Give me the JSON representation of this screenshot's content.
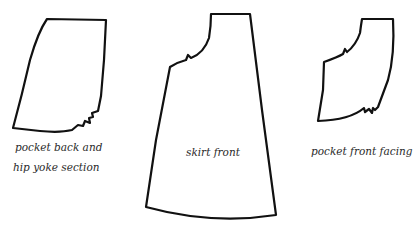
{
  "diagram": {
    "type": "sewing-pattern-pieces",
    "line_color": "#111111",
    "background": "#ffffff",
    "pieces": [
      {
        "id": "pocket-back",
        "label_lines": [
          "pocket back and",
          "hip yoke section"
        ]
      },
      {
        "id": "skirt-front",
        "label_lines": [
          "skirt front"
        ]
      },
      {
        "id": "pocket-front-facing",
        "label_lines": [
          "pocket front facing"
        ]
      }
    ]
  }
}
